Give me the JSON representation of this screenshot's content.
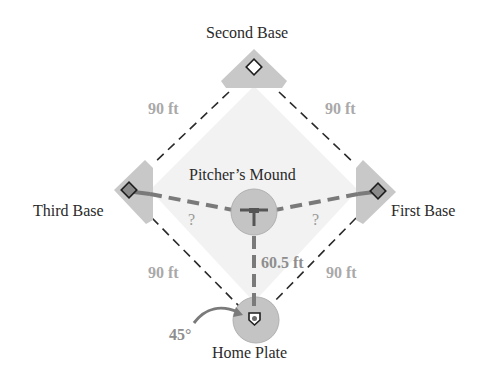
{
  "diagram": {
    "labels": {
      "second_base": "Second Base",
      "third_base": "Third Base",
      "first_base": "First Base",
      "pitchers_mound": "Pitcher’s Mound",
      "home_plate": "Home Plate"
    },
    "distances": {
      "top_left": "90 ft",
      "top_right": "90 ft",
      "bottom_left": "90 ft",
      "bottom_right": "90 ft",
      "mound_to_home": "60.5 ft",
      "mound_to_third": "?",
      "mound_to_first": "?"
    },
    "angle": "45°",
    "colors": {
      "field_fill": "#f2f2f2",
      "base_area": "#c8c8c8",
      "circle_fill": "#c4c4c4",
      "dashed_line": "#2a2a2a",
      "measure_line": "#7a7a7a",
      "label_text": "#2a2a2a",
      "distance_text": "#a9a9a9"
    }
  }
}
